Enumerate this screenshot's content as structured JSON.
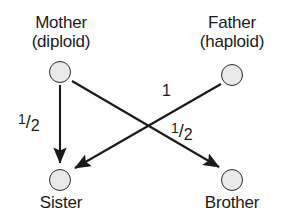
{
  "diagram": {
    "type": "directed-graph",
    "background_color": "#ffffff",
    "node_fill_color": "#e9e9e9",
    "node_stroke_color": "#2b2b2b",
    "edge_color": "#1a1a1a"
  },
  "nodes": [
    {
      "id": "mother",
      "label_line1": "Mother",
      "label_line2": "(diploid)",
      "x": 60,
      "y": 72,
      "label_position": "above"
    },
    {
      "id": "father",
      "label_line1": "Father",
      "label_line2": "(haploid)",
      "x": 232,
      "y": 75,
      "label_position": "above"
    },
    {
      "id": "sister",
      "label_line1": "Sister",
      "label_line2": "",
      "x": 60,
      "y": 180,
      "label_position": "below"
    },
    {
      "id": "brother",
      "label_line1": "Brother",
      "label_line2": "",
      "x": 232,
      "y": 180,
      "label_position": "below"
    }
  ],
  "edges": [
    {
      "id": "mother-to-sister",
      "from": "mother",
      "to": "sister",
      "label_numerator": "1",
      "label_divider": "/",
      "label_denominator": "2",
      "label_x": 22,
      "label_y": 116
    },
    {
      "id": "mother-to-brother",
      "from": "mother",
      "to": "brother",
      "label_numerator": "1",
      "label_divider": "/",
      "label_denominator": "2",
      "label_x": 174,
      "label_y": 124
    },
    {
      "id": "father-to-sister",
      "from": "father",
      "to": "sister",
      "label_numerator": "1",
      "label_divider": "",
      "label_denominator": "",
      "label_x": 162,
      "label_y": 80
    }
  ]
}
